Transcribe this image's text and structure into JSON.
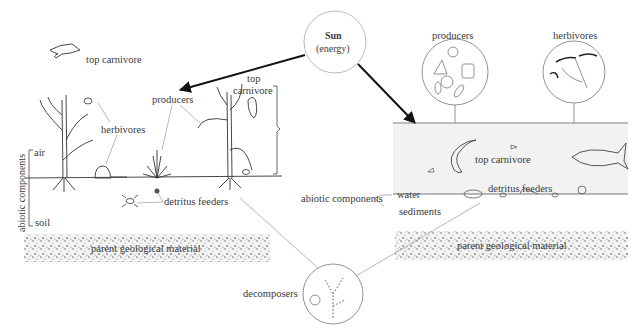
{
  "sun": {
    "title": "Sun",
    "subtitle": "(energy)"
  },
  "terrestrial": {
    "bird_label": "top carnivore",
    "producers": "producers",
    "top_carnivore_line1": "top",
    "top_carnivore_line2": "carnivore",
    "herbivores": "herbivores",
    "detritus_feeders": "detritus feeders",
    "abiotic_components": "abiotic components",
    "air": "air",
    "soil": "soil",
    "parent_material": "parent geological material"
  },
  "aquatic": {
    "producers": "producers",
    "herbivores": "herbivores",
    "top_carnivore": "top carnivore",
    "detritus_feeders": "detritus feeders",
    "abiotic_components": "abiotic components",
    "water": "water",
    "sediments": "sediments",
    "parent_material": "parent geological material"
  },
  "decomposers": {
    "label": "decomposers"
  },
  "colors": {
    "water": "#f2f2f2",
    "line": "#222222",
    "leader": "#888888"
  }
}
